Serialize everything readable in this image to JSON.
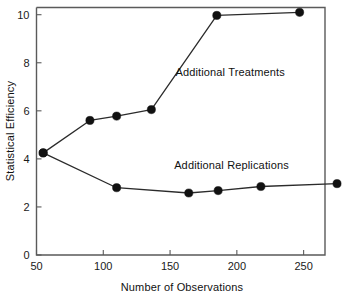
{
  "chart_data": {
    "type": "line",
    "title": "",
    "xlabel": "Number of Observations",
    "ylabel": "Statistical Efficiency",
    "xlim": [
      50,
      266
    ],
    "ylim": [
      0,
      10.3
    ],
    "xticks": [
      50,
      100,
      150,
      200,
      250
    ],
    "yticks": [
      0,
      2,
      4,
      6,
      8,
      10
    ],
    "xtick_labels": [
      "50",
      "100",
      "150",
      "200",
      "250"
    ],
    "ytick_labels": [
      "0",
      "2",
      "4",
      "6",
      "8",
      "10"
    ],
    "grid": false,
    "legend": "inline-annotations",
    "marker": "filled-circle",
    "series": [
      {
        "name": "Additional Treatments",
        "annotation": "Additional Treatments",
        "annotation_x": 195,
        "annotation_y": 7.45,
        "x": [
          55,
          90,
          110,
          136,
          185,
          247
        ],
        "y": [
          4.25,
          5.6,
          5.78,
          6.05,
          9.97,
          10.1
        ]
      },
      {
        "name": "Additional Replications",
        "annotation": "Additional Replications",
        "annotation_x": 196,
        "annotation_y": 3.6,
        "x": [
          55,
          110,
          164,
          186,
          218,
          275
        ],
        "y": [
          4.25,
          2.8,
          2.58,
          2.68,
          2.85,
          2.97
        ]
      }
    ]
  }
}
